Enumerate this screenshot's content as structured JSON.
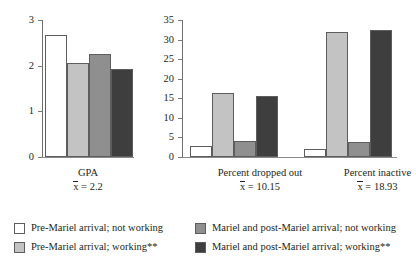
{
  "chart_data": [
    {
      "type": "bar",
      "panel_id": "gpa",
      "title": "",
      "xlabel": "GPA",
      "ylabel": "",
      "ylim": [
        0,
        3
      ],
      "ytick_step": 1,
      "ytick_labels": [
        "0",
        "1",
        "2",
        "3"
      ],
      "grid": false,
      "categories": [
        "GPA"
      ],
      "group_captions": [
        {
          "line1": "GPA",
          "line2_prefix": "x",
          "line2_rest": " = 2.2",
          "mean": 2.2
        }
      ],
      "series": [
        {
          "name": "Pre-Mariel arrival; not working",
          "values": [
            2.68
          ],
          "color": "#ffffff"
        },
        {
          "name": "Pre-Mariel arrival; working**",
          "values": [
            2.06
          ],
          "color": "#c3c3c3"
        },
        {
          "name": "Mariel and post-Mariel arrival; not working",
          "values": [
            2.25
          ],
          "color": "#8f8f8f"
        },
        {
          "name": "Mariel and post-Mariel arrival; working**",
          "values": [
            1.93
          ],
          "color": "#3e3e3e"
        }
      ]
    },
    {
      "type": "bar",
      "panel_id": "percent",
      "title": "",
      "xlabel": "",
      "ylabel": "",
      "ylim": [
        0,
        35
      ],
      "ytick_step": 5,
      "ytick_labels": [
        "0",
        "5",
        "10",
        "15",
        "20",
        "25",
        "30",
        "35"
      ],
      "grid": false,
      "categories": [
        "Percent dropped out",
        "Percent inactive"
      ],
      "group_captions": [
        {
          "line1": "Percent dropped out",
          "line2_prefix": "x",
          "line2_rest": " = 10.15",
          "mean": 10.15
        },
        {
          "line1": "Percent inactive",
          "line2_prefix": "x",
          "line2_rest": " = 18.93",
          "mean": 18.93
        }
      ],
      "series": [
        {
          "name": "Pre-Mariel arrival; not working",
          "values": [
            2.8,
            2.0
          ],
          "color": "#ffffff"
        },
        {
          "name": "Pre-Mariel arrival; working**",
          "values": [
            16.3,
            31.9
          ],
          "color": "#c3c3c3"
        },
        {
          "name": "Mariel and post-Mariel arrival; not working",
          "values": [
            4.1,
            3.9
          ],
          "color": "#8f8f8f"
        },
        {
          "name": "Mariel and post-Mariel arrival; working**",
          "values": [
            15.5,
            32.4
          ],
          "color": "#3e3e3e"
        }
      ]
    }
  ],
  "legend": {
    "position": "bottom",
    "items": [
      {
        "label": "Pre-Mariel arrival; not working",
        "color": "#ffffff"
      },
      {
        "label": "Mariel and post-Mariel arrival; not working",
        "color": "#8f8f8f"
      },
      {
        "label": "Pre-Mariel arrival; working**",
        "color": "#c3c3c3"
      },
      {
        "label": "Mariel and post-Mariel arrival; working**",
        "color": "#3e3e3e"
      }
    ]
  }
}
